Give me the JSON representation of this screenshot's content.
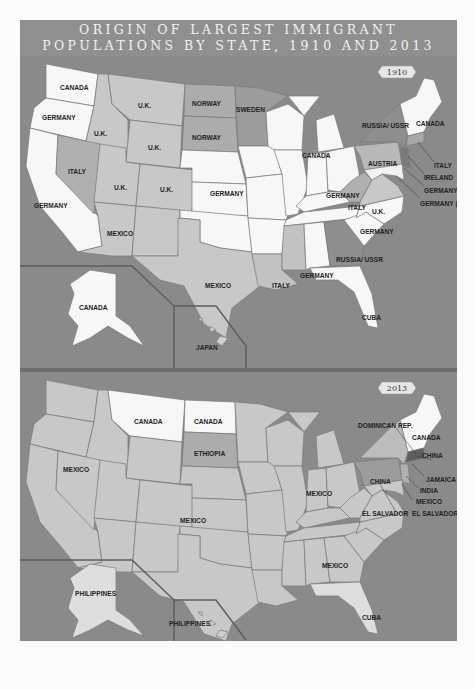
{
  "title": {
    "line1": "ORIGIN OF LARGEST IMMIGRANT",
    "line2": "POPULATIONS BY STATE, 1910 AND 2013"
  },
  "colors": {
    "water": "#8a8a8a",
    "title_band": "#8f8f8f",
    "white_state": "#f7f7f7",
    "light_state": "#dcdcdc",
    "mid_state": "#c2c2c2",
    "dark_state": "#9c9c9c",
    "darkest_state": "#6a6a6a",
    "border": "#7a7a7a"
  },
  "maps": [
    {
      "year": "1910",
      "labels": {
        "WA": "CANADA",
        "OR": "GERMANY",
        "CA": "GERMANY",
        "ID": "U.K.",
        "MT": "U.K.",
        "WY": "U.K.",
        "NV": "ITALY",
        "UT": "U.K.",
        "CO": "U.K.",
        "AZ": "MEXICO",
        "ND": "NORWAY",
        "SD": "NORWAY",
        "MN": "SWEDEN",
        "KS": "GERMANY",
        "TX": "MEXICO",
        "MI": "CANADA",
        "OH": "GERMANY",
        "WV": "ITALY",
        "VA": "U.K.",
        "NC": "GERMANY",
        "AL": "GERMANY",
        "GA": "RUSSIA/ USSR",
        "LA": "ITALY",
        "FL": "CUBA",
        "NY": "RUSSIA/ USSR",
        "PA": "AUSTRIA",
        "NE_REGION": "CANADA",
        "CT_callout": "ITALY",
        "NJ_callout": "IRELAND",
        "DE_callout": "GERMANY",
        "DC_callout": "GERMANY (D.C.)",
        "AK": "CANADA",
        "HI": "JAPAN"
      }
    },
    {
      "year": "2013",
      "labels": {
        "MT": "CANADA",
        "ND": "CANADA",
        "SD": "ETHIOPIA",
        "NV": "MEXICO",
        "CO": "MEXICO",
        "IN": "MEXICO",
        "GA": "MEXICO",
        "FL": "CUBA",
        "PA": "CHINA",
        "NY_callout": "DOMINICAN REP.",
        "NE_REGION": "CANADA",
        "MA_callout": "CHINA",
        "CT_callout": "JAMAICA",
        "NJ_callout": "INDIA",
        "DE_callout": "MEXICO",
        "MD_callout": "EL SALVADOR",
        "DC_callout": "EL SALVADOR (D.C.)",
        "AK": "PHILIPPINES",
        "HI": "PHILIPPINES"
      }
    }
  ]
}
